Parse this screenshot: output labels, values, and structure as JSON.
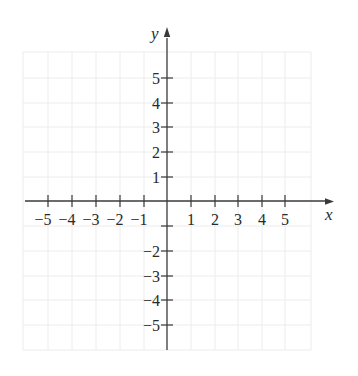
{
  "diagram": {
    "type": "cartesian-coordinate-plane",
    "axes": {
      "x": {
        "label": "x",
        "min": -5,
        "max": 5,
        "tick_step": 1
      },
      "y": {
        "label": "y",
        "min": -5,
        "max": 5,
        "tick_step": 1
      }
    },
    "x_tick_labels": [
      "−5",
      "−4",
      "−3",
      "−2",
      "−1",
      "1",
      "2",
      "3",
      "4",
      "5"
    ],
    "y_tick_labels": [
      "5",
      "4",
      "3",
      "2",
      "1",
      "−2",
      "−3",
      "−4",
      "−5"
    ],
    "grid": {
      "visible": true,
      "color": "#ececec",
      "cells_x": 12,
      "cells_y": 12
    },
    "colors": {
      "axis": "#3a3a3a",
      "text": "#2a2a2a",
      "background": "#ffffff"
    }
  },
  "labels": {
    "x_axis": "x",
    "y_axis": "y",
    "x_ticks": {
      "n5": "−5",
      "n4": "−4",
      "n3": "−3",
      "n2": "−2",
      "n1": "−1",
      "p1": "1",
      "p2": "2",
      "p3": "3",
      "p4": "4",
      "p5": "5"
    },
    "y_ticks": {
      "p5": "5",
      "p4": "4",
      "p3": "3",
      "p2": "2",
      "p1": "1",
      "n2": "−2",
      "n3": "−3",
      "n4": "−4",
      "n5": "−5"
    }
  }
}
